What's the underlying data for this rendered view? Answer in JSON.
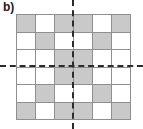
{
  "figure": {
    "panel_label": "b)",
    "colors": {
      "shaded_cell": "#c9c9c9",
      "empty_cell": "#ffffff",
      "grid_line": "#8f8f8f",
      "axis_line": "#2b2b2b",
      "label_text": "#1a1a1a"
    }
  },
  "chart_data": {
    "type": "heatmap",
    "title": "b)",
    "xlabel": "",
    "ylabel": "",
    "rows": 6,
    "cols": 6,
    "legend": [
      "shaded",
      "empty"
    ],
    "categories": [
      "c1",
      "c2",
      "c3",
      "c4",
      "c5",
      "c6"
    ],
    "row_labels": [
      "r1",
      "r2",
      "r3",
      "r4",
      "r5",
      "r6"
    ],
    "values": [
      [
        1,
        0,
        1,
        1,
        0,
        1
      ],
      [
        0,
        1,
        0,
        0,
        1,
        0
      ],
      [
        0,
        0,
        1,
        1,
        0,
        0
      ],
      [
        0,
        0,
        1,
        1,
        0,
        0
      ],
      [
        0,
        1,
        0,
        0,
        1,
        0
      ],
      [
        1,
        0,
        1,
        1,
        0,
        1
      ]
    ],
    "grid": true,
    "annotations": [
      {
        "name": "vertical-symmetry-axis",
        "orientation": "vertical",
        "position": 3
      },
      {
        "name": "horizontal-symmetry-axis",
        "orientation": "horizontal",
        "position": 3
      }
    ]
  }
}
